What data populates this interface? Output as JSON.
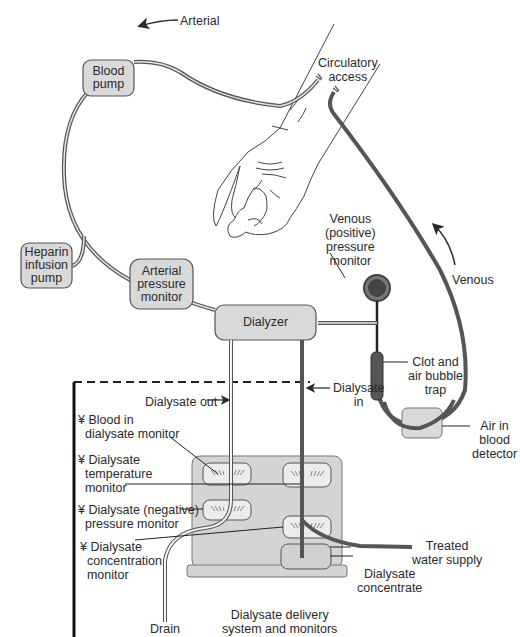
{
  "diagram": {
    "components": {
      "blood_pump": "Blood\npump",
      "heparin_pump": "Heparin\ninfusion\npump",
      "arterial_monitor": "Arterial\npressure\nmonitor",
      "dialyzer": "Dialyzer"
    },
    "labels": {
      "arterial": "Arterial",
      "circulatory_access": "Circulatory\naccess",
      "venous_monitor": "Venous\n(positive)\npressure\nmonitor",
      "venous": "Venous",
      "clot_trap": "Clot and\nair bubble\ntrap",
      "air_detector": "Air in\nblood\ndetector",
      "dialysate_out": "Dialysate out",
      "dialysate_in": "Dialysate\nin",
      "blood_in_dialysate": "¥ Blood in\n  dialysate monitor",
      "temp_monitor": "¥ Dialysate\n  temperature\n  monitor",
      "neg_pressure": "¥ Dialysate (negative)\n  pressure monitor",
      "concentration": "¥ Dialysate\n  concentration\n  monitor",
      "drain": "Drain",
      "treated_water": "Treated\nwater supply",
      "concentrate": "Dialysate\nconcentrate",
      "delivery_system": "Dialysate delivery\nsystem and monitors"
    },
    "colors": {
      "box_fill": "#d9d9d9",
      "box_stroke": "#555555",
      "tube_dark": "#555555",
      "text": "#2a2a2a",
      "machine_fill": "#d4d4d4"
    }
  }
}
